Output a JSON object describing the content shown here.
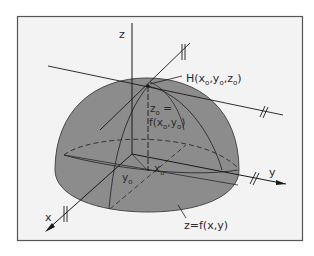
{
  "diagram": {
    "title": "",
    "colors": {
      "background": "#ffffff",
      "panel": "#f3f3f3",
      "frame": "#555555",
      "surface": "#8c8c8c",
      "surface_edge": "#4a4a4a",
      "line": "#222222"
    },
    "labels": {
      "z_axis": "z",
      "x_axis": "x",
      "y_axis": "y",
      "point_H": "H(x",
      "point_H_sub0": "o",
      "point_H_mid1": ",y",
      "point_H_sub1": "o",
      "point_H_mid2": ",z",
      "point_H_sub2": "o",
      "point_H_end": ")",
      "z0_line1": "z",
      "z0_line1_sub": "o",
      "z0_line1_eq": " =",
      "z0_line2_a": "f(x",
      "z0_line2_sub1": "o",
      "z0_line2_b": ",y",
      "z0_line2_sub2": "o",
      "z0_line2_c": ")",
      "x0": "x",
      "x0_sub": "o",
      "y0": "y",
      "y0_sub": "o",
      "surface": "z=f(x,y)"
    },
    "elements": [
      "coordinate axes x, y, z",
      "hemispherical surface z=f(x,y)",
      "point H(x0,y0,z0) on surface",
      "two tangent lines through H",
      "projection of H to (x0,y0) on base plane"
    ]
  }
}
